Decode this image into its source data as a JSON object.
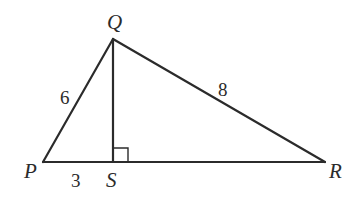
{
  "diagram": {
    "type": "geometry-triangle",
    "vertices": {
      "P": {
        "label": "P",
        "x": 43,
        "y": 162
      },
      "Q": {
        "label": "Q",
        "x": 113,
        "y": 39
      },
      "R": {
        "label": "R",
        "x": 325,
        "y": 162
      },
      "S": {
        "label": "S",
        "x": 113,
        "y": 162
      }
    },
    "segments": [
      {
        "name": "PQ",
        "from": "P",
        "to": "Q",
        "length_label": "6"
      },
      {
        "name": "QR",
        "from": "Q",
        "to": "R",
        "length_label": "8"
      },
      {
        "name": "PR",
        "from": "P",
        "to": "R",
        "length_label": ""
      },
      {
        "name": "QS",
        "from": "Q",
        "to": "S",
        "length_label": ""
      }
    ],
    "measure_labels": {
      "PQ": "6",
      "QR": "8",
      "PS": "3"
    },
    "right_angle_at": "S",
    "colors": {
      "stroke": "#2b2b2b",
      "background": "#ffffff"
    }
  }
}
